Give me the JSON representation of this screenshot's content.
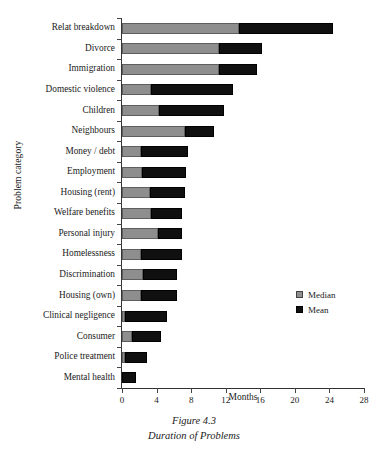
{
  "caption": {
    "line1": "Figure 4.3",
    "line2": "Duration of Problems"
  },
  "legend": {
    "position": "right-middle",
    "items": [
      {
        "label": "Median",
        "color": "#8e8e8e"
      },
      {
        "label": "Mean",
        "color": "#101010"
      }
    ]
  },
  "chart_data": {
    "type": "bar",
    "orientation": "horizontal",
    "stacked": true,
    "title": "Duration of Problems",
    "xlabel": "Months",
    "ylabel": "Problem category",
    "xlim": [
      0,
      28
    ],
    "xticks": [
      0,
      4,
      8,
      12,
      16,
      20,
      24,
      28
    ],
    "grid": false,
    "categories": [
      "Relat breakdown",
      "Divorce",
      "Immigration",
      "Domestic violence",
      "Children",
      "Neighbours",
      "Money / debt",
      "Employment",
      "Housing (rent)",
      "Welfare benefits",
      "Personal injury",
      "Homelessness",
      "Discrimination",
      "Housing (own)",
      "Clinical negligence",
      "Consumer",
      "Police treatment",
      "Mental health"
    ],
    "series": [
      {
        "name": "Median",
        "color": "#8e8e8e",
        "values": [
          13.5,
          11.2,
          11.2,
          3.4,
          4.3,
          7.3,
          2.2,
          2.3,
          3.2,
          3.4,
          4.2,
          2.2,
          2.4,
          2.2,
          0.4,
          1.2,
          0.4,
          0.0
        ]
      },
      {
        "name": "Mean",
        "color": "#101010",
        "values": [
          24.4,
          16.2,
          15.6,
          12.8,
          11.8,
          10.6,
          7.6,
          7.4,
          7.3,
          6.9,
          6.9,
          6.9,
          6.4,
          6.4,
          5.2,
          4.5,
          2.9,
          1.6
        ]
      }
    ]
  }
}
